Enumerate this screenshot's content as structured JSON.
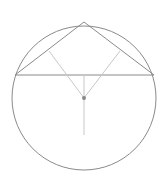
{
  "diagram": {
    "type": "geometry",
    "colors": {
      "background": "#ffffff",
      "primary_stroke": "#8a8a8a",
      "secondary_stroke": "#c8c8c8",
      "center_point": "#888888"
    },
    "circle": {
      "cx": 84,
      "cy": 98,
      "r": 72
    },
    "apex": {
      "x": 84,
      "y": 22
    },
    "chord": {
      "x1": 15,
      "y1": 75,
      "x2": 154,
      "y2": 75
    },
    "triangle_sides": [
      {
        "x1": 15,
        "y1": 75,
        "x2": 84,
        "y2": 22
      },
      {
        "x1": 84,
        "y1": 22,
        "x2": 154,
        "y2": 75
      }
    ],
    "bisectors": [
      {
        "x1": 49,
        "y1": 51,
        "x2": 84,
        "y2": 98
      },
      {
        "x1": 120,
        "y1": 51,
        "x2": 84,
        "y2": 98
      },
      {
        "x1": 84,
        "y1": 75,
        "x2": 84,
        "y2": 98
      }
    ],
    "radius_line": {
      "x1": 84,
      "y1": 98,
      "x2": 84,
      "y2": 135
    },
    "center_point": {
      "x": 84,
      "y": 98,
      "r": 2
    }
  }
}
